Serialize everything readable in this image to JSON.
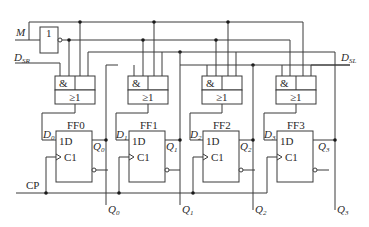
{
  "diagram": {
    "type": "bidirectional shift register (4-bit)",
    "inputs": {
      "mode": "M",
      "serial_right": "D",
      "serial_right_sub": "SR",
      "serial_left": "D",
      "serial_left_sub": "SL",
      "clock": "CP"
    },
    "inverter_label": "1",
    "gates": [
      {
        "and_label": "&",
        "or_label": "≥1"
      },
      {
        "and_label": "&",
        "or_label": "≥1"
      },
      {
        "and_label": "&",
        "or_label": "≥1"
      },
      {
        "and_label": "&",
        "or_label": "≥1"
      }
    ],
    "flipflops": [
      {
        "name": "FF0",
        "d_in": "D",
        "d_sub": "0",
        "pin_d": "1D",
        "pin_c": "C1",
        "q": "Q",
        "q_sub": "0"
      },
      {
        "name": "FF1",
        "d_in": "D",
        "d_sub": "1",
        "pin_d": "1D",
        "pin_c": "C1",
        "q": "Q",
        "q_sub": "1"
      },
      {
        "name": "FF2",
        "d_in": "D",
        "d_sub": "2",
        "pin_d": "1D",
        "pin_c": "C1",
        "q": "Q",
        "q_sub": "2"
      },
      {
        "name": "FF3",
        "d_in": "D",
        "d_sub": "3",
        "pin_d": "1D",
        "pin_c": "C1",
        "q": "Q",
        "q_sub": "3"
      }
    ],
    "outputs": [
      {
        "q": "Q",
        "sub": "0"
      },
      {
        "q": "Q",
        "sub": "1"
      },
      {
        "q": "Q",
        "sub": "2"
      },
      {
        "q": "Q",
        "sub": "3"
      }
    ]
  }
}
